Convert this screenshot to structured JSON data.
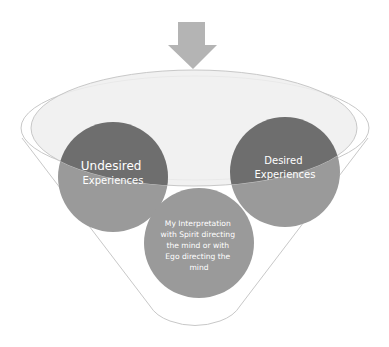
{
  "diagram": {
    "type": "funnel",
    "colors": {
      "arrow": "#b4b4b4",
      "funnel_outline": "#c8c8c8",
      "funnel_fill": "#ffffff",
      "inner_ellipse_fill": "#efefef",
      "circle_dark": "#6e6e6e",
      "circle_light": "#9a9a9a",
      "text": "#ffffff"
    },
    "input_arrow": {
      "icon": "down-arrow-icon"
    },
    "circles": [
      {
        "id": "undesired",
        "lines": [
          "Undesired",
          "Experiences"
        ]
      },
      {
        "id": "desired",
        "lines": [
          "Desired",
          "Experiences"
        ]
      },
      {
        "id": "interpretation",
        "lines": [
          "My Interpretation",
          "with Spirit directing",
          "the mind or with",
          "Ego directing the",
          "mind"
        ]
      }
    ]
  }
}
